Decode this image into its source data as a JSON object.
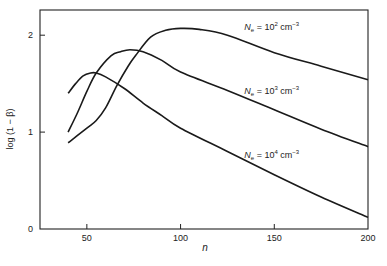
{
  "chart_data": {
    "type": "line",
    "title": "",
    "xlabel": "n",
    "ylabel": "log (1 − β)",
    "xlim": [
      25,
      200
    ],
    "ylim": [
      0,
      2.26
    ],
    "x_ticks": [
      50,
      100,
      150,
      200
    ],
    "x_tick_labels": [
      "50",
      "100",
      "150",
      "200"
    ],
    "y_ticks": [
      0,
      1,
      2
    ],
    "y_tick_labels": [
      "0",
      "1",
      "2"
    ],
    "grid": false,
    "legend": "inline labels at right",
    "series": [
      {
        "name": "N_e = 10^2 cm^-3",
        "label_parts": {
          "base": "N",
          "sub": "e",
          "eq": " = 10",
          "exp": "2",
          "unit": " cm",
          "unit_exp": "−3"
        },
        "x": [
          40,
          50,
          55,
          60,
          66,
          72,
          76,
          84,
          92,
          100,
          110,
          125,
          150,
          175,
          200
        ],
        "y": [
          0.89,
          1.04,
          1.12,
          1.25,
          1.48,
          1.68,
          1.79,
          1.98,
          2.05,
          2.07,
          2.06,
          2.0,
          1.82,
          1.68,
          1.54
        ]
      },
      {
        "name": "N_e = 10^3 cm^-3",
        "label_parts": {
          "base": "N",
          "sub": "e",
          "eq": " = 10",
          "exp": "3",
          "unit": " cm",
          "unit_exp": "−3"
        },
        "x": [
          40,
          45,
          50,
          55,
          63,
          68,
          73,
          80,
          90,
          100,
          125,
          150,
          175,
          200
        ],
        "y": [
          1.0,
          1.2,
          1.42,
          1.61,
          1.79,
          1.83,
          1.85,
          1.83,
          1.74,
          1.62,
          1.43,
          1.23,
          1.03,
          0.85
        ]
      },
      {
        "name": "N_e = 10^4 cm^-3",
        "label_parts": {
          "base": "N",
          "sub": "e",
          "eq": " = 10",
          "exp": "4",
          "unit": " cm",
          "unit_exp": "−3"
        },
        "x": [
          40,
          44,
          48,
          52,
          55,
          60,
          70,
          80,
          90,
          100,
          125,
          150,
          175,
          200
        ],
        "y": [
          1.4,
          1.5,
          1.58,
          1.61,
          1.61,
          1.57,
          1.45,
          1.3,
          1.17,
          1.04,
          0.8,
          0.56,
          0.33,
          0.12
        ]
      }
    ],
    "annotations": [
      {
        "series": 0,
        "at_x": 150,
        "at_y": 2.05
      },
      {
        "series": 1,
        "at_x": 150,
        "at_y": 1.39
      },
      {
        "series": 2,
        "at_x": 150,
        "at_y": 0.73
      }
    ]
  },
  "colors": {
    "line": "#1a1a1a",
    "axis": "#222222",
    "text": "#222222"
  }
}
